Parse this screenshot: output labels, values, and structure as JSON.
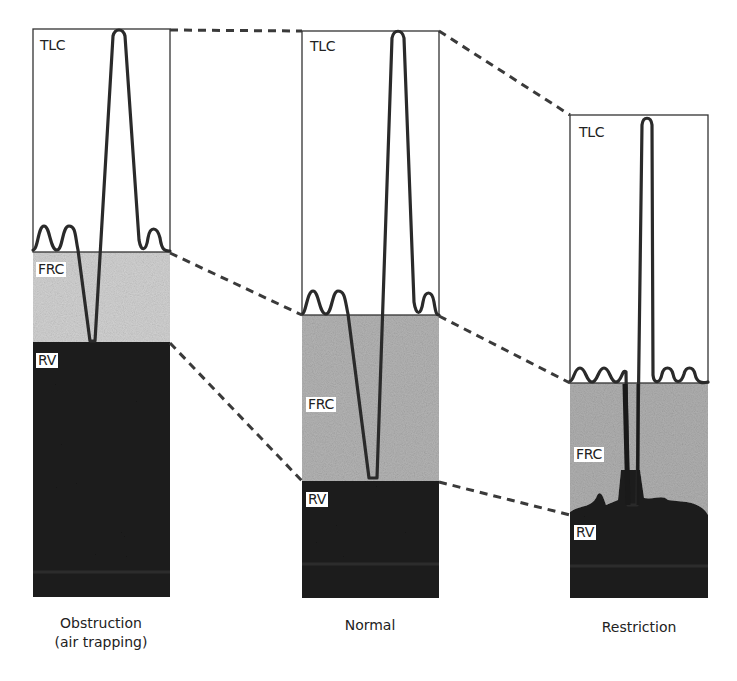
{
  "figure": {
    "type": "lung volume comparison diagram",
    "dashed_connectors": true
  },
  "panels": [
    {
      "id": "obstruction",
      "caption_line1": "Obstruction",
      "caption_line2": "(air trapping)",
      "labels": {
        "tlc": "TLC",
        "frc": "FRC",
        "rv": "RV"
      },
      "levels_px": {
        "tlc_top": 29,
        "frc": 252,
        "rv": 342,
        "bottom": 597
      }
    },
    {
      "id": "normal",
      "caption_line1": "Normal",
      "labels": {
        "tlc": "TLC",
        "frc": "FRC",
        "rv": "RV"
      },
      "levels_px": {
        "tlc_top": 31,
        "frc": 315,
        "rv": 481,
        "bottom": 598
      }
    },
    {
      "id": "restriction",
      "caption_line1": "Restriction",
      "labels": {
        "tlc": "TLC",
        "frc": "FRC",
        "rv": "RV"
      },
      "levels_px": {
        "tlc_top": 115,
        "frc": 383,
        "rv": 515,
        "bottom": 598
      }
    }
  ],
  "colors": {
    "outline": "#333333",
    "trace": "#2a2a2a",
    "frc_fill": "#bdbdbd",
    "rv_fill": "#1e1e1e",
    "dashed": "#3a3a3a"
  }
}
